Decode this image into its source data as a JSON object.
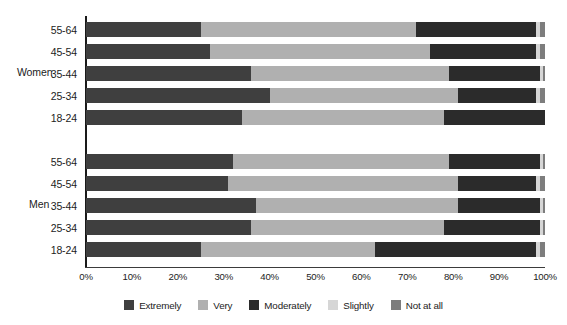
{
  "chart_data": {
    "type": "bar",
    "orientation": "horizontal",
    "stacked": true,
    "stack_mode": "percent",
    "title": "",
    "xlabel": "",
    "ylabel": "",
    "xlim": [
      0,
      100
    ],
    "grid": false,
    "legend_position": "bottom",
    "xtick_labels": [
      "0%",
      "10%",
      "20%",
      "30%",
      "40%",
      "50%",
      "60%",
      "70%",
      "80%",
      "90%",
      "100%"
    ],
    "xtick_values": [
      0,
      10,
      20,
      30,
      40,
      50,
      60,
      70,
      80,
      90,
      100
    ],
    "series": [
      {
        "name": "Extremely",
        "color": "#3f3f3f"
      },
      {
        "name": "Very",
        "color": "#b0b0b0"
      },
      {
        "name": "Moderately",
        "color": "#2b2b2b"
      },
      {
        "name": "Slightly",
        "color": "#d6d6d6"
      },
      {
        "name": "Not at all",
        "color": "#7d7d7d"
      }
    ],
    "groups": [
      {
        "name": "Women",
        "rows": [
          {
            "label": "55-64",
            "values": [
              25,
              47,
              26,
              1,
              1
            ]
          },
          {
            "label": "45-54",
            "values": [
              27,
              48,
              23,
              1,
              1
            ]
          },
          {
            "label": "35-44",
            "values": [
              36,
              43,
              20,
              0.6,
              0.4
            ]
          },
          {
            "label": "25-34",
            "values": [
              40,
              41,
              17,
              1,
              1
            ]
          },
          {
            "label": "18-24",
            "values": [
              34,
              44,
              22,
              0,
              0
            ]
          }
        ]
      },
      {
        "name": "Men",
        "rows": [
          {
            "label": "55-64",
            "values": [
              32,
              47,
              20,
              0.6,
              0.4
            ]
          },
          {
            "label": "45-54",
            "values": [
              31,
              50,
              17,
              1,
              1
            ]
          },
          {
            "label": "35-44",
            "values": [
              37,
              44,
              18,
              0.6,
              0.4
            ]
          },
          {
            "label": "25-34",
            "values": [
              36,
              42,
              21,
              0.6,
              0.4
            ]
          },
          {
            "label": "18-24",
            "values": [
              25,
              38,
              35,
              1,
              1
            ]
          }
        ]
      }
    ]
  },
  "legend": {
    "items": [
      {
        "label": "Extremely",
        "color": "#3f3f3f"
      },
      {
        "label": "Very",
        "color": "#b0b0b0"
      },
      {
        "label": "Moderately",
        "color": "#2b2b2b"
      },
      {
        "label": "Slightly",
        "color": "#d6d6d6"
      },
      {
        "label": "Not at all",
        "color": "#7d7d7d"
      }
    ]
  }
}
